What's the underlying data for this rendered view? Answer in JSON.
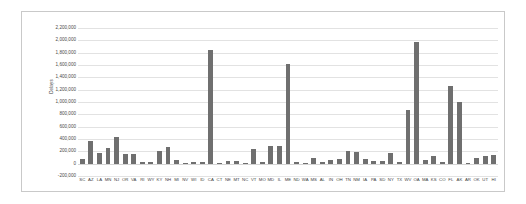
{
  "chart_data": {
    "type": "bar",
    "title": "",
    "subtitle": "",
    "xlabel": "",
    "ylabel": "Delays",
    "ylim": [
      -200000,
      2200000
    ],
    "ytick_step": 200000,
    "yticks": [
      "2,200,000",
      "2,000,000",
      "1,800,000",
      "1,600,000",
      "1,400,000",
      "1,200,000",
      "1,000,000",
      "800,000",
      "600,000",
      "400,000",
      "200,000",
      "0",
      "-200,000"
    ],
    "ytick_values": [
      2200000,
      2000000,
      1800000,
      1600000,
      1400000,
      1200000,
      1000000,
      800000,
      600000,
      400000,
      200000,
      0,
      -200000
    ],
    "grid": true,
    "grid_axis": "y",
    "legend": false,
    "legend_position": "none",
    "bar_color": "#6f6f6f",
    "plot_background": "#ffffff",
    "frame_border_color": "#c9c9c9",
    "categories": [
      "SC",
      "AZ",
      "LA",
      "MN",
      "NJ",
      "OR",
      "VA",
      "RI",
      "WY",
      "KY",
      "NH",
      "MI",
      "NV",
      "WI",
      "ID",
      "CA",
      "CT",
      "NE",
      "MT",
      "NC",
      "VT",
      "MO",
      "MD",
      "IL",
      "ME",
      "ND",
      "WA",
      "MS",
      "AL",
      "IN",
      "OH",
      "TN",
      "NM",
      "IA",
      "PA",
      "SD",
      "NY",
      "TX",
      "WV",
      "OA",
      "MA",
      "KS",
      "CO",
      "FL",
      "AK",
      "AR",
      "OK",
      "UT",
      "HI"
    ],
    "values": [
      80000,
      360000,
      180000,
      250000,
      430000,
      160000,
      150000,
      30000,
      20000,
      200000,
      270000,
      60000,
      15000,
      25000,
      20000,
      1840000,
      12000,
      40000,
      40000,
      12000,
      230000,
      20000,
      290000,
      280000,
      1620000,
      25000,
      10000,
      85000,
      20000,
      55000,
      80000,
      200000,
      195000,
      75000,
      45000,
      40000,
      175000,
      25000,
      870000,
      1970000,
      60000,
      130000,
      20000,
      1260000,
      1000000,
      18000,
      100000,
      130000,
      140000
    ]
  }
}
